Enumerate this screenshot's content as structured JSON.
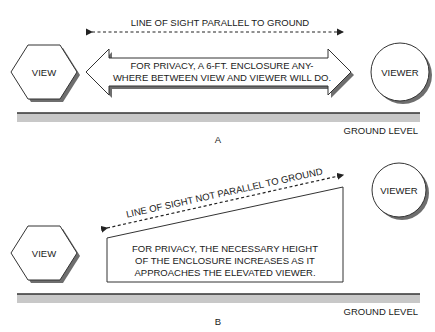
{
  "panels": [
    {
      "id": "A",
      "caption": "A",
      "line_of_sight_label": "LINE OF SIGHT PARALLEL TO GROUND",
      "view_label": "VIEW",
      "viewer_label": "VIEWER",
      "enclosure_note_line1": "FOR PRIVACY, A 6-FT. ENCLOSURE ANY-",
      "enclosure_note_line2": "WHERE BETWEEN VIEW AND VIEWER WILL DO.",
      "ground_label": "GROUND LEVEL"
    },
    {
      "id": "B",
      "caption": "B",
      "line_of_sight_label": "LINE OF SIGHT NOT PARALLEL TO GROUND",
      "view_label": "VIEW",
      "viewer_label": "VIEWER",
      "enclosure_note_line1": "FOR PRIVACY, THE NECESSARY HEIGHT",
      "enclosure_note_line2": "OF THE ENCLOSURE INCREASES AS IT",
      "enclosure_note_line3": "APPROACHES THE ELEVATED VIEWER.",
      "ground_label": "GROUND LEVEL"
    }
  ],
  "colors": {
    "ink": "#1a1a1a",
    "outline": "#333333",
    "shadow": "#6e6e6e",
    "ground_fill": "#c8c8c8",
    "background": "#ffffff"
  }
}
